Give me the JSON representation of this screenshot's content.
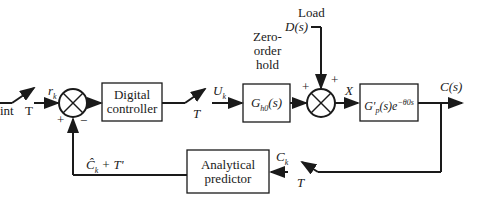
{
  "diagram": {
    "type": "block-diagram",
    "title": "",
    "blocks": {
      "digital_controller": {
        "line1": "Digital",
        "line2": "controller"
      },
      "zoh": {
        "label": "G",
        "sub": "h0",
        "arg": "(s)",
        "caption1": "Zero-",
        "caption2": "order",
        "caption3": "hold"
      },
      "plant": {
        "label": "G'",
        "sub": "p",
        "arg": "(s)e",
        "exp": "−θ0s"
      },
      "predictor": {
        "line1": "Analytical",
        "line2": "predictor"
      }
    },
    "signals": {
      "setpoint_partial": "int",
      "sampler_1": "T",
      "rk": "r",
      "rk_sub": "k",
      "plus_1": "+",
      "minus_1": "−",
      "uk": "U",
      "uk_sub": "k",
      "sampler_2": "T",
      "load_title": "Load",
      "load": "D(s)",
      "plus_2a": "+",
      "plus_2b": "+",
      "x": "X",
      "output": "C(s)",
      "ck": "C",
      "ck_sub": "k",
      "sampler_3": "T",
      "feedback": "Ĉ",
      "feedback_sub": "k",
      "feedback_rest": " + T'"
    }
  }
}
